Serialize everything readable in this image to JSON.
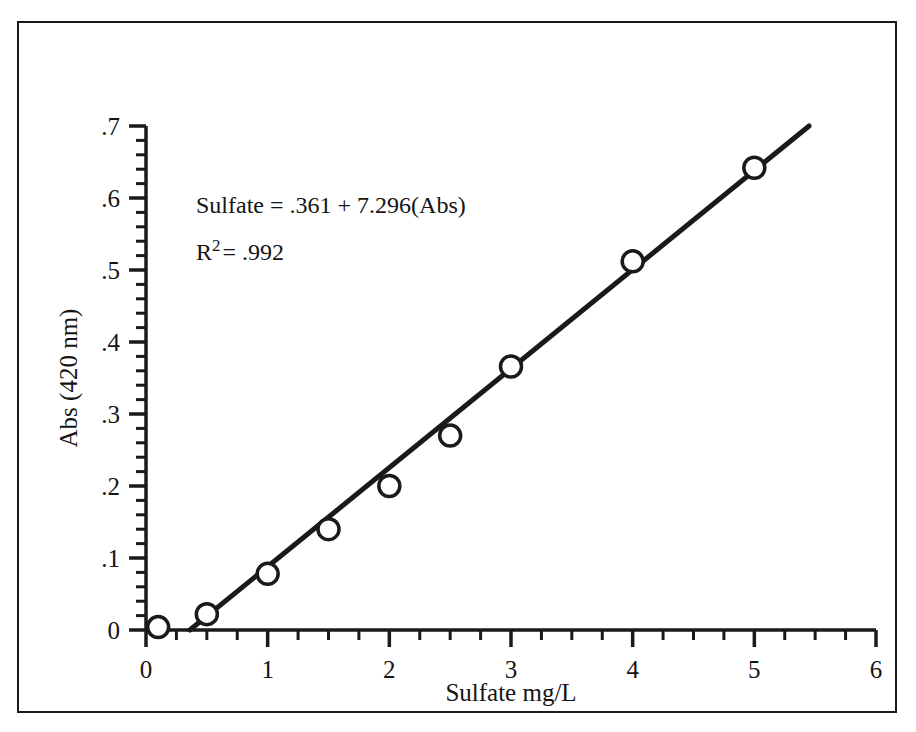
{
  "chart_data": {
    "type": "scatter",
    "title": "",
    "xlabel": "Sulfate mg/L",
    "ylabel": "Abs (420 nm)",
    "xlim": [
      0,
      6
    ],
    "ylim": [
      0,
      0.7
    ],
    "grid": false,
    "legend": null,
    "x_ticks": [
      "0",
      "1",
      "2",
      "3",
      "4",
      "5",
      "6"
    ],
    "x_tick_values": [
      0,
      1,
      2,
      3,
      4,
      5,
      6
    ],
    "x_minor_step": 0.25,
    "y_ticks": [
      "0",
      ".1",
      ".2",
      ".3",
      ".4",
      ".5",
      ".6",
      ".7"
    ],
    "y_tick_values": [
      0,
      0.1,
      0.2,
      0.3,
      0.4,
      0.5,
      0.6,
      0.7
    ],
    "y_minor_step": 0.02,
    "marker": "open-circle",
    "x": [
      0.1,
      0.5,
      1.0,
      1.5,
      2.0,
      2.5,
      3.0,
      4.0,
      5.0
    ],
    "values": [
      0.004,
      0.022,
      0.078,
      0.14,
      0.2,
      0.27,
      0.366,
      0.512,
      0.642
    ],
    "points": [
      {
        "x": 0.1,
        "y": 0.004
      },
      {
        "x": 0.5,
        "y": 0.022
      },
      {
        "x": 1.0,
        "y": 0.078
      },
      {
        "x": 1.5,
        "y": 0.14
      },
      {
        "x": 2.0,
        "y": 0.2
      },
      {
        "x": 2.5,
        "y": 0.27
      },
      {
        "x": 3.0,
        "y": 0.366
      },
      {
        "x": 4.0,
        "y": 0.512
      },
      {
        "x": 5.0,
        "y": 0.642
      }
    ],
    "fit_line": {
      "type": "line",
      "x_start": 0.36,
      "y_start": 0.0,
      "x_end": 5.45,
      "y_end": 0.7,
      "slope": 0.1371,
      "intercept": -0.0495
    },
    "annotations": {
      "equation": "Sulfate = .361 + 7.296(Abs)",
      "r_label": "R",
      "r_exponent": "2",
      "r_value": "= .992"
    }
  },
  "style": {
    "line_color": "#1a1a1a",
    "marker_edge_color": "#1a1a1a",
    "marker_face_color": "#ffffff",
    "axis_color": "#1a1a1a",
    "border_color": "#1a1a1a",
    "background": "#ffffff"
  }
}
